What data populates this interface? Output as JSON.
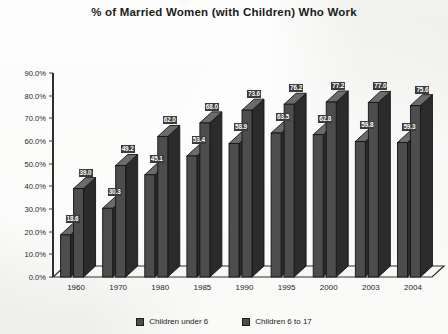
{
  "chart_data": {
    "type": "bar",
    "title": "% of Married Women (with Children) Who Work",
    "xlabel": "",
    "ylabel": "",
    "ylim": [
      0,
      90
    ],
    "ytick_labels": [
      "0.0%",
      "10.0%",
      "20.0%",
      "30.0%",
      "40.0%",
      "50.0%",
      "60.0%",
      "70.0%",
      "80.0%",
      "90.0%"
    ],
    "ytick_values": [
      0,
      10,
      20,
      30,
      40,
      50,
      60,
      70,
      80,
      90
    ],
    "grid": false,
    "legend_position": "bottom",
    "categories": [
      "1960",
      "1970",
      "1980",
      "1985",
      "1990",
      "1995",
      "2000",
      "2003",
      "2004"
    ],
    "series": [
      {
        "name": "Children under 6",
        "color": "#4d4d4d",
        "values": [
          18.6,
          30.3,
          45.1,
          53.4,
          58.9,
          63.5,
          62.8,
          59.8,
          59.3
        ],
        "labels": [
          "18.6",
          "30.3",
          "45.1",
          "53.4",
          "58.9",
          "63.5",
          "62.8",
          "59.8",
          "59.3"
        ]
      },
      {
        "name": "Children 6 to 17",
        "color": "#4d4d4d",
        "values": [
          39.0,
          49.2,
          62.0,
          68.0,
          73.6,
          76.2,
          77.2,
          77.0,
          75.6
        ],
        "labels": [
          "39.0",
          "49.2",
          "62.0",
          "68.0",
          "73.6",
          "76.2",
          "77.2",
          "77.0",
          "75.6"
        ]
      }
    ]
  },
  "legend": {
    "items": [
      {
        "label": "Children under 6"
      },
      {
        "label": "Children 6 to 17"
      }
    ]
  }
}
